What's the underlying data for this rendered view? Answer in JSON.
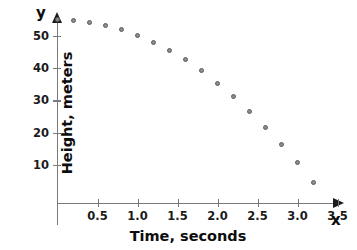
{
  "chart_data": {
    "type": "scatter",
    "title": "",
    "subtitle": "",
    "xlabel": "Time, seconds",
    "ylabel": "Height, meters",
    "x_axis_letter": "x",
    "y_axis_letter": "y",
    "xlim": [
      0,
      3.6
    ],
    "ylim": [
      0,
      58
    ],
    "grid": false,
    "legend": null,
    "legend_position": "none",
    "x_ticks": [
      0.5,
      1.0,
      1.5,
      2.0,
      2.5,
      3.0,
      3.5
    ],
    "x_tick_labels": [
      "0.5",
      "1.0",
      "1.5",
      "2.0",
      "2.5",
      "3.0",
      "3.5"
    ],
    "y_ticks": [
      10,
      20,
      30,
      40,
      50
    ],
    "y_tick_labels": [
      "10",
      "20",
      "30",
      "40",
      "50"
    ],
    "series": [
      {
        "name": "Height vs Time",
        "marker": "open-circle",
        "color": "#8c8c8c",
        "points": [
          {
            "x": 0.0,
            "y": 55.0
          },
          {
            "x": 0.2,
            "y": 54.8
          },
          {
            "x": 0.4,
            "y": 54.2
          },
          {
            "x": 0.6,
            "y": 53.3
          },
          {
            "x": 0.8,
            "y": 52.0
          },
          {
            "x": 1.0,
            "y": 50.2
          },
          {
            "x": 1.2,
            "y": 48.0
          },
          {
            "x": 1.4,
            "y": 45.4
          },
          {
            "x": 1.6,
            "y": 42.5
          },
          {
            "x": 1.8,
            "y": 39.1
          },
          {
            "x": 2.0,
            "y": 35.3
          },
          {
            "x": 2.2,
            "y": 31.2
          },
          {
            "x": 2.4,
            "y": 26.6
          },
          {
            "x": 2.6,
            "y": 21.7
          },
          {
            "x": 2.8,
            "y": 16.4
          },
          {
            "x": 3.0,
            "y": 10.7
          },
          {
            "x": 3.2,
            "y": 4.6
          }
        ]
      }
    ]
  }
}
